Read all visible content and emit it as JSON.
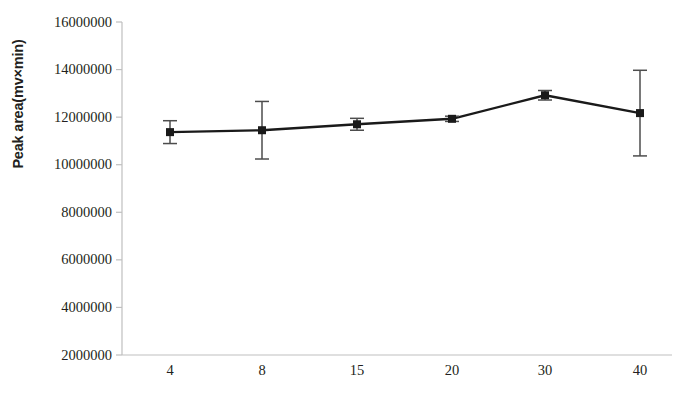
{
  "chart_data": {
    "type": "line",
    "title": "",
    "subtitle": "",
    "xlabel": "Volume of ethyl acetate(μl)",
    "ylabel": "Peak area(mv×min)",
    "categories": [
      "4",
      "8",
      "15",
      "20",
      "30",
      "40"
    ],
    "values": [
      11370000,
      11450000,
      11700000,
      11930000,
      12920000,
      12170000
    ],
    "errors": [
      480000,
      1210000,
      250000,
      110000,
      200000,
      1800000
    ],
    "series": [
      {
        "name": "Peak area",
        "values": [
          11370000,
          11450000,
          11700000,
          11930000,
          12920000,
          12170000
        ],
        "errors": [
          480000,
          1210000,
          250000,
          110000,
          200000,
          1800000
        ]
      }
    ],
    "ylim": [
      2000000,
      16000000
    ],
    "yticks": [
      2000000,
      4000000,
      6000000,
      8000000,
      10000000,
      12000000,
      14000000,
      16000000
    ],
    "ytick_labels": [
      "2000000",
      "4000000",
      "6000000",
      "8000000",
      "10000000",
      "12000000",
      "14000000",
      "16000000"
    ],
    "xtick_labels": [
      "4",
      "8",
      "15",
      "20",
      "30",
      "40"
    ],
    "grid": false,
    "legend": null,
    "legend_position": "none",
    "marker": "square",
    "line_color": "#1a1a1a",
    "marker_color": "#1a1a1a",
    "errorbar_color": "#4d4d4d",
    "axis_color": "#bfbfbf",
    "background_color": "#ffffff",
    "annotations": []
  }
}
